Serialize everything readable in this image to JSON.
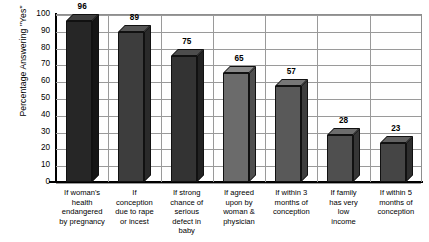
{
  "chart_data": {
    "type": "bar",
    "title": "",
    "xlabel": "",
    "ylabel": "Percentage Answering \"Yes\"",
    "ylim": [
      0,
      100
    ],
    "ytick_step": 10,
    "yticks": [
      100,
      90,
      80,
      70,
      60,
      50,
      40,
      30,
      20,
      10,
      0
    ],
    "grid": true,
    "legend": "none",
    "style": "3d-bars-grayscale",
    "categories": [
      "If woman's health endangered by pregnancy",
      "If conception due to rape or incest",
      "If strong chance of serious defect in baby",
      "If agreed upon by woman & physician",
      "If within 3 months of conception",
      "If family has very low income",
      "If within 5 months of conception"
    ],
    "category_lines": [
      [
        "If woman's",
        "health",
        "endangered",
        "by pregnancy"
      ],
      [
        "If",
        "conception",
        "due to rape",
        "or incest"
      ],
      [
        "If strong",
        "chance of",
        "serious",
        "defect in",
        "baby"
      ],
      [
        "If agreed",
        "upon by",
        "woman &",
        "physician"
      ],
      [
        "If within 3",
        "months of",
        "conception"
      ],
      [
        "If family",
        "has very",
        "low",
        "income"
      ],
      [
        "If within 5",
        "months of",
        "conception"
      ]
    ],
    "values": [
      96,
      89,
      75,
      65,
      57,
      28,
      23
    ],
    "bar_colors": [
      "#262626",
      "#3d3d3d",
      "#333333",
      "#6b6b6b",
      "#595959",
      "#4f4f4f",
      "#454545"
    ],
    "bar_top_colors": [
      "#3f3f3f",
      "#565656",
      "#4d4d4d",
      "#8a8a8a",
      "#777777",
      "#6d6d6d",
      "#626262"
    ],
    "bar_side_colors": [
      "#151515",
      "#2a2a2a",
      "#222222",
      "#4f4f4f",
      "#3e3e3e",
      "#363636",
      "#2e2e2e"
    ],
    "background": "#ffffff",
    "gridline_color": "#9a9a9a",
    "axis_color": "#000000"
  }
}
